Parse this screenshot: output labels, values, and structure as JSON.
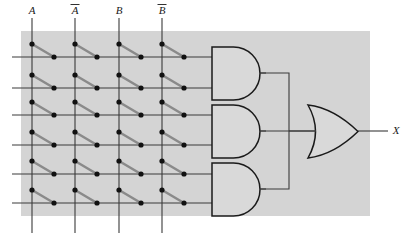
{
  "figure": {
    "name": "pla-logic-diagram",
    "type": "logic-circuit",
    "width": 413,
    "height": 241
  },
  "colors": {
    "panel_background": "#d4d4d4",
    "page_background": "#ffffff",
    "wire": "#3a3a3a",
    "link_wire": "#8a8a8a",
    "gate_fill": "#d9d9d9",
    "gate_stroke": "#1a1a1a",
    "dot": "#111111",
    "text": "#1a1a1a"
  },
  "panel": {
    "x": 21,
    "y": 31,
    "width": 349,
    "height": 185
  },
  "inputs": {
    "labels": [
      {
        "text": "A",
        "overbar": false,
        "x": 32
      },
      {
        "text": "A",
        "overbar": true,
        "x": 75
      },
      {
        "text": "B",
        "overbar": false,
        "x": 119
      },
      {
        "text": "B",
        "overbar": true,
        "x": 162
      }
    ],
    "line_top": 18,
    "line_bottom": 233
  },
  "product_rows": {
    "count": 6,
    "y": [
      57,
      88,
      115,
      145,
      174,
      203
    ],
    "x_start": 12,
    "x_end": 212
  },
  "fuse_links": {
    "description": "diagonal connector from input column down-right to product row",
    "dot_radius": 2.6,
    "columns_x": [
      32,
      75,
      119,
      162
    ],
    "link_dx": 22,
    "link_dy": 13
  },
  "and_gates": [
    {
      "name": "and-gate-1",
      "x": 212,
      "y": 47,
      "width": 48,
      "height": 53,
      "inputs": [
        1,
        2
      ],
      "output_y": 73
    },
    {
      "name": "and-gate-2",
      "x": 212,
      "y": 105,
      "width": 48,
      "height": 53,
      "inputs": [
        3,
        4
      ],
      "output_y": 131
    },
    {
      "name": "and-gate-3",
      "x": 212,
      "y": 163,
      "width": 48,
      "height": 53,
      "inputs": [
        5,
        6
      ],
      "output_y": 189
    }
  ],
  "or_gate": {
    "name": "or-gate",
    "x": 308,
    "y": 105,
    "width": 50,
    "height": 53,
    "bus_x": 289,
    "output_y": 131
  },
  "output": {
    "label": "X",
    "label_x": 396,
    "label_y": 134,
    "wire_x_start": 358,
    "wire_x_end": 388
  }
}
